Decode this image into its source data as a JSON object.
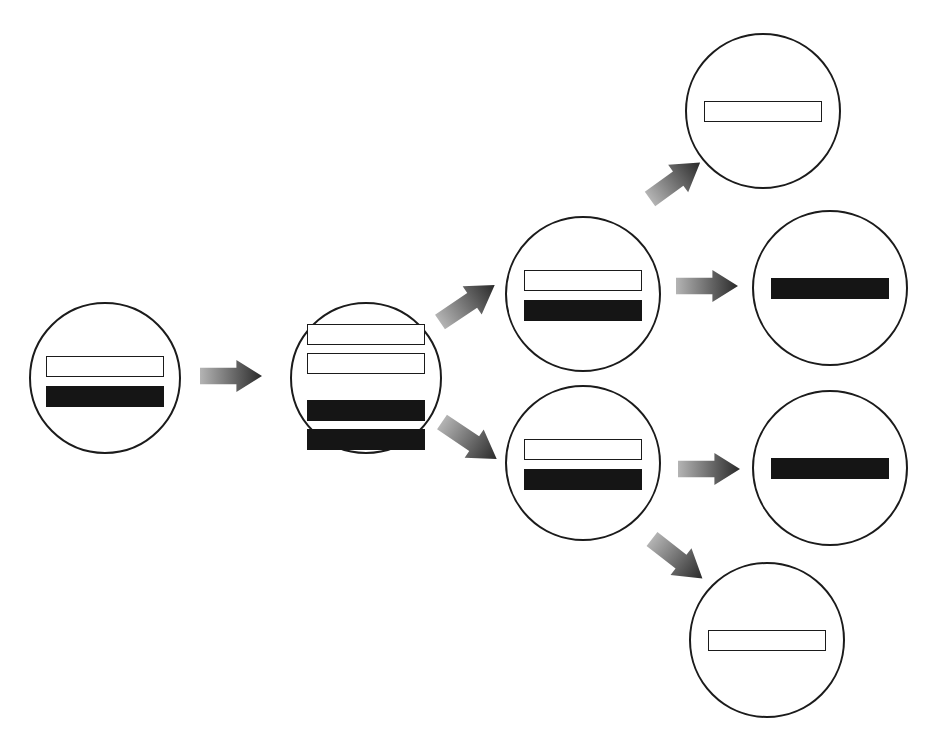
{
  "diagram": {
    "type": "branching-process-diagram",
    "title": "",
    "canvas": {
      "width": 934,
      "height": 747,
      "background": "#ffffff"
    },
    "style": {
      "circle_stroke": "#1b1b1b",
      "circle_fill": "#ffffff",
      "bar_white_fill": "#ffffff",
      "bar_white_stroke": "#1b1b1b",
      "bar_black_fill": "#151515",
      "arrow_gradient_start": "#b4b4b4",
      "arrow_gradient_end": "#2a2a2a"
    },
    "nodes": [
      {
        "id": "node-start",
        "label": "start-cell",
        "cx": 105,
        "cy": 378,
        "r": 76,
        "bars": [
          {
            "style": "white",
            "width": 118,
            "height": 21
          },
          {
            "style": "black",
            "width": 118,
            "height": 21
          }
        ],
        "bar_gap": 9,
        "bars_offset_y": -24
      },
      {
        "id": "node-replicated",
        "label": "replicated-cell",
        "cx": 366,
        "cy": 378,
        "r": 76,
        "bars": [
          {
            "style": "white",
            "width": 118,
            "height": 21
          },
          {
            "style": "white",
            "width": 118,
            "height": 21
          },
          {
            "style": "black",
            "width": 118,
            "height": 21
          },
          {
            "style": "black",
            "width": 118,
            "height": 21
          }
        ],
        "bar_gap": 8,
        "bar_group_gap": 26,
        "bars_offset_y": -56
      },
      {
        "id": "node-upper-daughter",
        "label": "upper-daughter-cell",
        "cx": 583,
        "cy": 294,
        "r": 78,
        "bars": [
          {
            "style": "white",
            "width": 118,
            "height": 21
          },
          {
            "style": "black",
            "width": 118,
            "height": 21
          }
        ],
        "bar_gap": 9,
        "bars_offset_y": -26
      },
      {
        "id": "node-lower-daughter",
        "label": "lower-daughter-cell",
        "cx": 583,
        "cy": 463,
        "r": 78,
        "bars": [
          {
            "style": "white",
            "width": 118,
            "height": 21
          },
          {
            "style": "black",
            "width": 118,
            "height": 21
          }
        ],
        "bar_gap": 9,
        "bars_offset_y": -26
      },
      {
        "id": "node-top-white",
        "label": "top-white-bar-cell",
        "cx": 763,
        "cy": 111,
        "r": 78,
        "bars": [
          {
            "style": "white",
            "width": 118,
            "height": 21
          }
        ],
        "bar_gap": 0,
        "bars_offset_y": -12
      },
      {
        "id": "node-upper-black",
        "label": "upper-black-bar-cell",
        "cx": 830,
        "cy": 288,
        "r": 78,
        "bars": [
          {
            "style": "black",
            "width": 118,
            "height": 21
          }
        ],
        "bar_gap": 0,
        "bars_offset_y": -12
      },
      {
        "id": "node-lower-black",
        "label": "lower-black-bar-cell",
        "cx": 830,
        "cy": 468,
        "r": 78,
        "bars": [
          {
            "style": "black",
            "width": 118,
            "height": 21
          }
        ],
        "bar_gap": 0,
        "bars_offset_y": -12
      },
      {
        "id": "node-bottom-white",
        "label": "bottom-white-bar-cell",
        "cx": 767,
        "cy": 640,
        "r": 78,
        "bars": [
          {
            "style": "white",
            "width": 118,
            "height": 21
          }
        ],
        "bar_gap": 0,
        "bars_offset_y": -12
      }
    ],
    "arrows": [
      {
        "id": "arrow-start-to-replicated",
        "label": "arrow-right-1",
        "from": "node-start",
        "to": "node-replicated",
        "x": 200,
        "y": 360,
        "length": 62,
        "thickness": 32,
        "rotation": 0
      },
      {
        "id": "arrow-replicated-to-upper",
        "label": "arrow-up-right-1",
        "from": "node-replicated",
        "to": "node-upper-daughter",
        "x": 440,
        "y": 305,
        "length": 66,
        "thickness": 34,
        "rotation": -34
      },
      {
        "id": "arrow-replicated-to-lower",
        "label": "arrow-down-right-1",
        "from": "node-replicated",
        "to": "node-lower-daughter",
        "x": 442,
        "y": 405,
        "length": 66,
        "thickness": 34,
        "rotation": 34
      },
      {
        "id": "arrow-upper-to-top",
        "label": "arrow-up-right-2",
        "from": "node-upper-daughter",
        "to": "node-top-white",
        "x": 650,
        "y": 182,
        "length": 62,
        "thickness": 34,
        "rotation": -36
      },
      {
        "id": "arrow-upper-to-black",
        "label": "arrow-right-2",
        "from": "node-upper-daughter",
        "to": "node-upper-black",
        "x": 676,
        "y": 270,
        "length": 62,
        "thickness": 32,
        "rotation": 0
      },
      {
        "id": "arrow-lower-to-black",
        "label": "arrow-right-3",
        "from": "node-lower-daughter",
        "to": "node-lower-black",
        "x": 678,
        "y": 453,
        "length": 62,
        "thickness": 32,
        "rotation": 0
      },
      {
        "id": "arrow-lower-to-bottom",
        "label": "arrow-down-right-2",
        "from": "node-lower-daughter",
        "to": "node-bottom-white",
        "x": 652,
        "y": 522,
        "length": 64,
        "thickness": 34,
        "rotation": 38
      }
    ]
  }
}
